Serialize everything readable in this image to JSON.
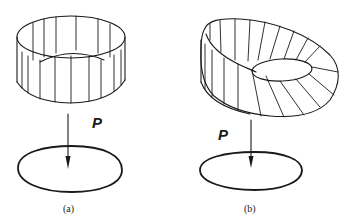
{
  "figure": {
    "panels": [
      {
        "id": "a",
        "caption": "(a)",
        "map_label": "P",
        "upper_surface": "vertical cylindrical band with rulings",
        "lower_shape": "closed curve (ellipse)"
      },
      {
        "id": "b",
        "caption": "(b)",
        "map_label": "P",
        "upper_surface": "tilted annular band with radial rulings",
        "lower_shape": "closed curve (ellipse)"
      }
    ],
    "colors": {
      "ink": "#1a1a1a",
      "background": "#ffffff"
    }
  }
}
